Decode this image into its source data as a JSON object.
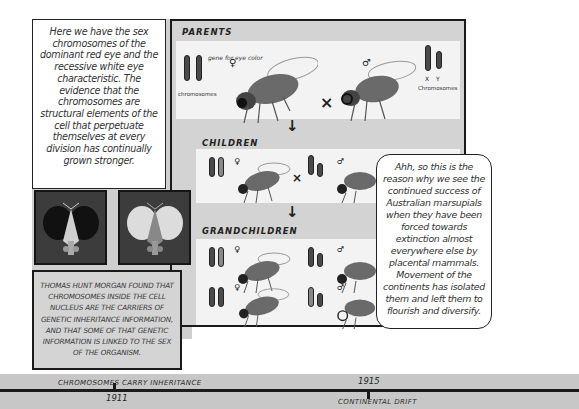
{
  "captions": {
    "top_left": "Here we have the sex chromosomes of the dominant red eye and the recessive white eye characteristic. The evidence that the chromosomes are structural elements of the cell that perpetuate themselves at every division has continually grown stronger.",
    "morgan": "Thomas Hunt Morgan found that chromosomes inside the cell nucleus are the carriers of genetic inheritance information, and that some of that genetic information is linked to the sex of the organism.",
    "speech_bubble": "Ahh, so this is the reason why we see the continued success of Australian marsupials when they have been forced towards extinction almost everywhere else by placental mammals. Movement of the continents has isolated them and left them to flourish and diversify."
  },
  "diagram": {
    "sections": {
      "parents": "Parents",
      "children": "Children",
      "grandchildren": "Grandchildren"
    },
    "annotations": {
      "gene_label": "gene for eye color",
      "chromosomes_left": "chromosomes",
      "chromosomes_right": "Chromosomes",
      "x_label": "X",
      "y_label": "Y",
      "cross": "×",
      "arrow": "↓",
      "female": "♀",
      "male": "♂"
    },
    "eye_images": [
      {
        "label": "red-eye",
        "color": "#1f1f1f"
      },
      {
        "label": "white-eye",
        "color": "#d8d8d8"
      }
    ]
  },
  "timeline": {
    "events": [
      {
        "label": "Chromosomes carry inheritance",
        "year": "1911"
      },
      {
        "label": "Continental drift",
        "year": "1915"
      }
    ]
  },
  "colors": {
    "panel_bg": "#d3d3d3",
    "white_area": "#f3f3f3",
    "border": "#1a1a1a",
    "timeline_bg": "#c7c7c7"
  }
}
